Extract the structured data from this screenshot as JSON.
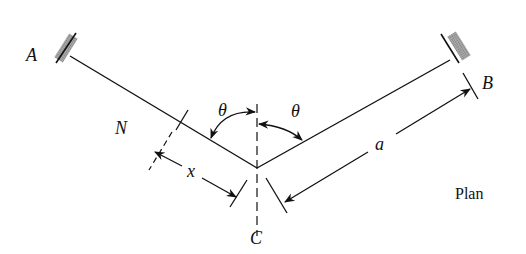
{
  "diagram": {
    "type": "structural plan view of bent beam with fixed supports",
    "caption": "Plan",
    "labels": {
      "support_left": "A",
      "support_right": "B",
      "vertex": "C",
      "section": "N",
      "angle_left": "θ",
      "angle_right": "θ",
      "dim_x": "x",
      "dim_a": "a"
    },
    "colors": {
      "line": "#111111",
      "support_fill": "#9a9a9a"
    }
  }
}
